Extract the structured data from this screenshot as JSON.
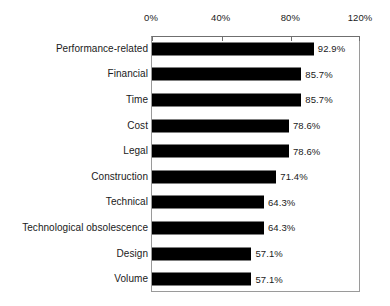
{
  "chart_data": {
    "type": "bar",
    "orientation": "horizontal",
    "title": "",
    "subtitle": "",
    "xlabel": "",
    "ylabel": "",
    "xlim": [
      0,
      120
    ],
    "grid": false,
    "legend": false,
    "axis_position": "top",
    "value_suffix": "%",
    "tick_labels": [
      "0%",
      "40%",
      "80%",
      "120%"
    ],
    "ticks": [
      0,
      40,
      80,
      120
    ],
    "categories": [
      "Performance-related",
      "Financial",
      "Time",
      "Cost",
      "Legal",
      "Construction",
      "Technical",
      "Technological obsolescence",
      "Design",
      "Volume"
    ],
    "values": [
      92.9,
      85.7,
      85.7,
      78.6,
      78.6,
      71.4,
      64.3,
      64.3,
      57.1,
      57.1
    ],
    "value_labels": [
      "92.9%",
      "85.7%",
      "85.7%",
      "78.6%",
      "78.6%",
      "71.4%",
      "64.3%",
      "64.3%",
      "57.1%",
      "57.1%"
    ],
    "bar_color": "#000000",
    "plot_background": "#ffffff",
    "frame_color": "#9a9a9a"
  }
}
